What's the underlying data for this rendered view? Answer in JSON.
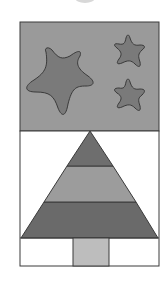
{
  "image": {
    "description": "Grayscale quilt-block illustration: night sky panel with three stars above a striped Christmas tree with a trunk",
    "colors": {
      "background": "#ffffff",
      "sky": "#9a9a9a",
      "star": "#7a7a7a",
      "outline": "#3a3a3a",
      "tree_top": "#6e6e6e",
      "tree_middle": "#9c9c9c",
      "tree_bottom": "#6a6a6a",
      "trunk": "#bdbdbd",
      "ground": "#ffffff",
      "partial_circle": "#d8d8d8"
    },
    "elements": {
      "stars_count": 3,
      "tree_bands": 3
    }
  }
}
